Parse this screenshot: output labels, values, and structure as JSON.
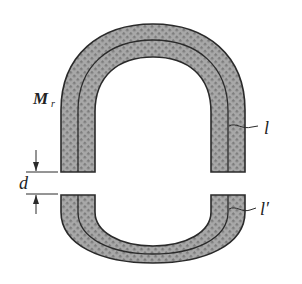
{
  "figure": {
    "labels": {
      "magnet": "M",
      "magnet_sub": "r",
      "path_upper": "l",
      "gap": "d",
      "path_lower": "l′"
    },
    "colors": {
      "fill": "#9a9a9a",
      "outline": "#2a2a2a",
      "background": "#ffffff"
    }
  }
}
